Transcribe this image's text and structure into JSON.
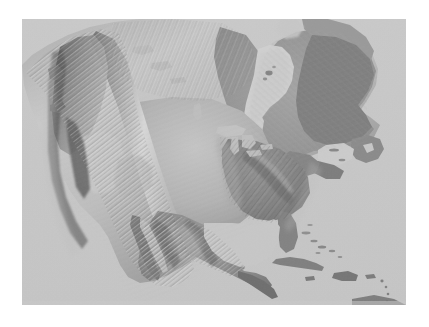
{
  "document": {
    "type": "shaded-relief-map",
    "title": "North America Shaded Relief",
    "subject": "North America",
    "projection": "Lambert Conformal Conic",
    "rendering": "grayscale hillshade",
    "background_color": "#ffffff",
    "ocean_color": "#c6c6c6",
    "land_low_color": "#8c8c8c",
    "land_high_color": "#e2e2e2",
    "shadow_color": "#4a4a4a",
    "has_labels": false,
    "has_graticule": false,
    "has_border": false,
    "has_legend": false,
    "has_scale_bar": false
  },
  "frame": {
    "x": 22,
    "y": 19,
    "width": 384,
    "height": 286
  },
  "features": {
    "water_bodies": [
      {
        "name": "Pacific Ocean",
        "type": "ocean"
      },
      {
        "name": "Atlantic Ocean",
        "type": "ocean"
      },
      {
        "name": "Arctic Ocean",
        "type": "ocean"
      },
      {
        "name": "Hudson Bay",
        "type": "bay"
      },
      {
        "name": "James Bay",
        "type": "bay"
      },
      {
        "name": "Gulf of Mexico",
        "type": "gulf"
      },
      {
        "name": "Gulf of California",
        "type": "gulf"
      },
      {
        "name": "Caribbean Sea",
        "type": "sea"
      },
      {
        "name": "Gulf of St. Lawrence",
        "type": "gulf"
      },
      {
        "name": "Great Lakes",
        "type": "lakes"
      },
      {
        "name": "Great Slave Lake",
        "type": "lake"
      },
      {
        "name": "Great Bear Lake",
        "type": "lake"
      },
      {
        "name": "Lake Winnipeg",
        "type": "lake"
      }
    ],
    "landmasses": [
      {
        "name": "Canada",
        "type": "country"
      },
      {
        "name": "United States",
        "type": "country"
      },
      {
        "name": "Mexico",
        "type": "country"
      },
      {
        "name": "Central America",
        "type": "region"
      },
      {
        "name": "Cuba",
        "type": "island"
      },
      {
        "name": "Hispaniola",
        "type": "island"
      },
      {
        "name": "Jamaica",
        "type": "island"
      },
      {
        "name": "Puerto Rico",
        "type": "island"
      },
      {
        "name": "Bahamas",
        "type": "archipelago"
      },
      {
        "name": "Newfoundland",
        "type": "island"
      },
      {
        "name": "Nova Scotia",
        "type": "peninsula"
      },
      {
        "name": "Baffin Island",
        "type": "island"
      },
      {
        "name": "Yucatan Peninsula",
        "type": "peninsula"
      },
      {
        "name": "Baja California",
        "type": "peninsula"
      },
      {
        "name": "Florida",
        "type": "peninsula"
      }
    ],
    "mountain_ranges": [
      {
        "name": "Rocky Mountains",
        "relief": "high"
      },
      {
        "name": "Sierra Nevada",
        "relief": "high"
      },
      {
        "name": "Cascade Range",
        "relief": "high"
      },
      {
        "name": "Coast Mountains",
        "relief": "high"
      },
      {
        "name": "Brooks Range",
        "relief": "moderate"
      },
      {
        "name": "Sierra Madre Occidental",
        "relief": "high"
      },
      {
        "name": "Sierra Madre Oriental",
        "relief": "high"
      },
      {
        "name": "Appalachian Mountains",
        "relief": "moderate"
      },
      {
        "name": "Great Basin",
        "relief": "moderate"
      },
      {
        "name": "Colorado Plateau",
        "relief": "moderate"
      },
      {
        "name": "Great Plains",
        "relief": "low"
      },
      {
        "name": "Canadian Shield",
        "relief": "low"
      },
      {
        "name": "Mississippi Valley",
        "relief": "low"
      }
    ]
  },
  "chart_data": {
    "type": "heatmap",
    "title": "North America Shaded Relief",
    "xlabel": "",
    "ylabel": "",
    "colorscale": "grayscale-hillshade",
    "legend": "none",
    "grid": false
  }
}
